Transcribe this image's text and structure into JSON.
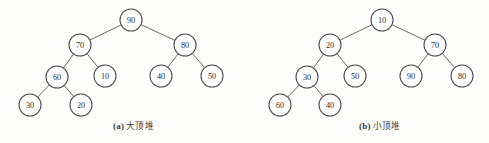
{
  "figure": {
    "background_color": "#fdfdfc",
    "node_fill_color": "#ffffff",
    "node_stroke_color": "#4a4a4a",
    "edge_color": "#5a5a5a",
    "text_color": "#2b2b2b"
  },
  "chart_data": {
    "type": "diagram",
    "title": "",
    "subtitle": "",
    "xlabel": "",
    "ylabel": "",
    "legend": [],
    "diagrams": [
      {
        "id": "max-heap",
        "caption_tag": "(a)",
        "caption_text": "大顶堆",
        "root": 90,
        "level_order_values": [
          90,
          70,
          80,
          60,
          10,
          40,
          50,
          30,
          20
        ],
        "nodes": [
          {
            "id": "a0",
            "label": "90",
            "cx": 131,
            "cy": 20,
            "r": 11
          },
          {
            "id": "a1",
            "label": "70",
            "cx": 80,
            "cy": 45,
            "r": 11
          },
          {
            "id": "a2",
            "label": "80",
            "cx": 185,
            "cy": 45,
            "r": 11
          },
          {
            "id": "a3",
            "label": "60",
            "cx": 57,
            "cy": 77,
            "r": 11
          },
          {
            "id": "a4",
            "label": "10",
            "cx": 105,
            "cy": 76,
            "r": 11
          },
          {
            "id": "a5",
            "label": "40",
            "cx": 161,
            "cy": 76,
            "r": 11
          },
          {
            "id": "a6",
            "label": "50",
            "cx": 212,
            "cy": 76,
            "r": 11
          },
          {
            "id": "a7",
            "label": "30",
            "cx": 30,
            "cy": 105,
            "r": 11
          },
          {
            "id": "a8",
            "label": "20",
            "cx": 81,
            "cy": 105,
            "r": 11
          }
        ],
        "edges": [
          {
            "from": "a0",
            "to": "a1"
          },
          {
            "from": "a0",
            "to": "a2"
          },
          {
            "from": "a1",
            "to": "a3"
          },
          {
            "from": "a1",
            "to": "a4"
          },
          {
            "from": "a2",
            "to": "a5"
          },
          {
            "from": "a2",
            "to": "a6"
          },
          {
            "from": "a3",
            "to": "a7"
          },
          {
            "from": "a3",
            "to": "a8"
          }
        ]
      },
      {
        "id": "min-heap",
        "caption_tag": "(b)",
        "caption_text": "小顶堆",
        "root": 10,
        "level_order_values": [
          10,
          20,
          70,
          30,
          50,
          90,
          80,
          60,
          40
        ],
        "nodes": [
          {
            "id": "b0",
            "label": "10",
            "cx": 382,
            "cy": 20,
            "r": 11
          },
          {
            "id": "b1",
            "label": "20",
            "cx": 330,
            "cy": 45,
            "r": 11
          },
          {
            "id": "b2",
            "label": "70",
            "cx": 435,
            "cy": 45,
            "r": 11
          },
          {
            "id": "b3",
            "label": "30",
            "cx": 307,
            "cy": 77,
            "r": 11
          },
          {
            "id": "b4",
            "label": "50",
            "cx": 355,
            "cy": 76,
            "r": 11
          },
          {
            "id": "b5",
            "label": "90",
            "cx": 411,
            "cy": 76,
            "r": 11
          },
          {
            "id": "b6",
            "label": "80",
            "cx": 462,
            "cy": 76,
            "r": 11
          },
          {
            "id": "b7",
            "label": "60",
            "cx": 280,
            "cy": 105,
            "r": 11
          },
          {
            "id": "b8",
            "label": "40",
            "cx": 330,
            "cy": 105,
            "r": 11
          }
        ],
        "edges": [
          {
            "from": "b0",
            "to": "b1"
          },
          {
            "from": "b0",
            "to": "b2"
          },
          {
            "from": "b1",
            "to": "b3"
          },
          {
            "from": "b1",
            "to": "b4"
          },
          {
            "from": "b2",
            "to": "b5"
          },
          {
            "from": "b2",
            "to": "b6"
          },
          {
            "from": "b3",
            "to": "b7"
          },
          {
            "from": "b3",
            "to": "b8"
          }
        ]
      }
    ]
  },
  "captions": {
    "a": {
      "tag": "(a)",
      "text": "大顶堆"
    },
    "b": {
      "tag": "(b)",
      "text": "小顶堆"
    }
  }
}
